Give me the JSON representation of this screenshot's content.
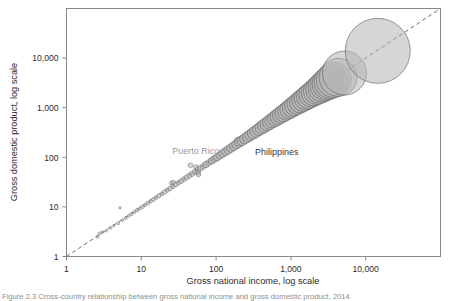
{
  "figure": {
    "background": "#ffffff",
    "caption": "Figure 2.3  Cross-country relationship between gross national income and gross domestic product, 2014"
  },
  "chart_data": {
    "type": "scatter",
    "title": "",
    "xlabel": "Gross national income, log scale",
    "ylabel": "Gross domestic product, log scale",
    "xscale": "log",
    "yscale": "log",
    "xlim": [
      1,
      100000
    ],
    "ylim": [
      1,
      100000
    ],
    "xticks": [
      1,
      10,
      100,
      1000,
      10000
    ],
    "xticklabels": [
      "1",
      "10",
      "100",
      "1,000",
      "10,000"
    ],
    "yticks": [
      1,
      10,
      100,
      1000,
      10000
    ],
    "yticklabels": [
      "1",
      "10",
      "100",
      "1,000",
      "10,000"
    ],
    "grid": false,
    "legend": null,
    "reference_line": {
      "type": "identity",
      "style": "dashed",
      "color": "#6e6e6e",
      "from": [
        1,
        1
      ],
      "to": [
        100000,
        100000
      ]
    },
    "marker_style": {
      "shape": "circle",
      "fill": "#b5b5b5",
      "fill_opacity": 0.55,
      "stroke": "#6b6b6b",
      "size_encodes": "population"
    },
    "annotations": [
      {
        "text": "Puerto Rico",
        "color": "#9a9a9a",
        "x": 26,
        "y": 115
      },
      {
        "text": "Philippines",
        "color": "#3a3a3a",
        "x": 330,
        "y": 110
      }
    ],
    "points": [
      {
        "x": 2.6,
        "y": 2.5,
        "r": 1.6
      },
      {
        "x": 2.75,
        "y": 2.9,
        "r": 1.5
      },
      {
        "x": 3.0,
        "y": 3.1,
        "r": 1.4
      },
      {
        "x": 3.4,
        "y": 3.3,
        "r": 1.3
      },
      {
        "x": 3.9,
        "y": 3.8,
        "r": 1.4
      },
      {
        "x": 4.3,
        "y": 4.2,
        "r": 1.3
      },
      {
        "x": 4.9,
        "y": 4.7,
        "r": 1.5
      },
      {
        "x": 5.2,
        "y": 9.6,
        "r": 1.2
      },
      {
        "x": 5.6,
        "y": 5.4,
        "r": 1.4
      },
      {
        "x": 6.2,
        "y": 6.0,
        "r": 1.5
      },
      {
        "x": 6.8,
        "y": 6.6,
        "r": 1.4
      },
      {
        "x": 7.4,
        "y": 7.2,
        "r": 1.6
      },
      {
        "x": 8.1,
        "y": 7.9,
        "r": 1.5
      },
      {
        "x": 8.8,
        "y": 8.6,
        "r": 1.7
      },
      {
        "x": 9.6,
        "y": 9.3,
        "r": 1.6
      },
      {
        "x": 10.4,
        "y": 10.1,
        "r": 1.8
      },
      {
        "x": 11.3,
        "y": 11.0,
        "r": 1.7
      },
      {
        "x": 12.3,
        "y": 12.0,
        "r": 1.9
      },
      {
        "x": 13.4,
        "y": 13.1,
        "r": 1.8
      },
      {
        "x": 14.6,
        "y": 14.2,
        "r": 2.0
      },
      {
        "x": 15.9,
        "y": 15.5,
        "r": 1.9
      },
      {
        "x": 17.3,
        "y": 16.9,
        "r": 2.1
      },
      {
        "x": 18.8,
        "y": 18.3,
        "r": 2.0
      },
      {
        "x": 20.5,
        "y": 20.0,
        "r": 2.2
      },
      {
        "x": 22.3,
        "y": 21.7,
        "r": 2.1
      },
      {
        "x": 24.3,
        "y": 23.7,
        "r": 2.3
      },
      {
        "x": 25.2,
        "y": 30.5,
        "r": 2.0
      },
      {
        "x": 26.4,
        "y": 25.8,
        "r": 2.2
      },
      {
        "x": 26.9,
        "y": 31.2,
        "r": 2.1
      },
      {
        "x": 28.8,
        "y": 28.1,
        "r": 2.4
      },
      {
        "x": 31.3,
        "y": 30.5,
        "r": 2.3
      },
      {
        "x": 34.1,
        "y": 33.2,
        "r": 2.5
      },
      {
        "x": 37.1,
        "y": 36.2,
        "r": 2.4
      },
      {
        "x": 40.4,
        "y": 39.4,
        "r": 2.6
      },
      {
        "x": 44.0,
        "y": 42.9,
        "r": 2.5
      },
      {
        "x": 45.5,
        "y": 69.0,
        "r": 2.4
      },
      {
        "x": 47.9,
        "y": 46.7,
        "r": 2.7
      },
      {
        "x": 52.1,
        "y": 50.8,
        "r": 2.6
      },
      {
        "x": 54.0,
        "y": 63.0,
        "r": 2.5
      },
      {
        "x": 56.8,
        "y": 55.3,
        "r": 2.8
      },
      {
        "x": 57.5,
        "y": 49.5,
        "r": 2.4
      },
      {
        "x": 58.2,
        "y": 45.0,
        "r": 2.3
      },
      {
        "x": 61.8,
        "y": 60.2,
        "r": 2.9
      },
      {
        "x": 67.3,
        "y": 65.6,
        "r": 2.8
      },
      {
        "x": 73.3,
        "y": 71.4,
        "r": 3.1
      },
      {
        "x": 79.8,
        "y": 77.8,
        "r": 3.0
      },
      {
        "x": 86.9,
        "y": 84.7,
        "r": 3.3
      },
      {
        "x": 94.6,
        "y": 92.2,
        "r": 3.4
      },
      {
        "x": 103,
        "y": 100,
        "r": 3.6
      },
      {
        "x": 112,
        "y": 109,
        "r": 3.7
      },
      {
        "x": 122,
        "y": 119,
        "r": 3.9
      },
      {
        "x": 133,
        "y": 130,
        "r": 4.0
      },
      {
        "x": 145,
        "y": 141,
        "r": 4.2
      },
      {
        "x": 158,
        "y": 154,
        "r": 4.3
      },
      {
        "x": 172,
        "y": 168,
        "r": 4.5
      },
      {
        "x": 187,
        "y": 182,
        "r": 4.6
      },
      {
        "x": 200,
        "y": 208,
        "r": 4.4
      },
      {
        "x": 204,
        "y": 199,
        "r": 4.8
      },
      {
        "x": 222,
        "y": 216,
        "r": 5.0
      },
      {
        "x": 242,
        "y": 236,
        "r": 5.2
      },
      {
        "x": 264,
        "y": 257,
        "r": 5.4
      },
      {
        "x": 287,
        "y": 280,
        "r": 5.6
      },
      {
        "x": 313,
        "y": 305,
        "r": 5.8
      },
      {
        "x": 341,
        "y": 332,
        "r": 6.0
      },
      {
        "x": 371,
        "y": 362,
        "r": 6.2
      },
      {
        "x": 404,
        "y": 394,
        "r": 6.5
      },
      {
        "x": 440,
        "y": 429,
        "r": 6.7
      },
      {
        "x": 479,
        "y": 467,
        "r": 7.0
      },
      {
        "x": 522,
        "y": 509,
        "r": 7.2
      },
      {
        "x": 568,
        "y": 554,
        "r": 7.5
      },
      {
        "x": 619,
        "y": 603,
        "r": 7.8
      },
      {
        "x": 674,
        "y": 657,
        "r": 8.1
      },
      {
        "x": 734,
        "y": 716,
        "r": 8.4
      },
      {
        "x": 800,
        "y": 780,
        "r": 8.7
      },
      {
        "x": 871,
        "y": 849,
        "r": 9.0
      },
      {
        "x": 949,
        "y": 925,
        "r": 9.4
      },
      {
        "x": 1034,
        "y": 1008,
        "r": 9.7
      },
      {
        "x": 1126,
        "y": 1098,
        "r": 10.1
      },
      {
        "x": 1226,
        "y": 1196,
        "r": 10.5
      },
      {
        "x": 1336,
        "y": 1302,
        "r": 10.9
      },
      {
        "x": 1455,
        "y": 1419,
        "r": 11.3
      },
      {
        "x": 1585,
        "y": 1545,
        "r": 11.7
      },
      {
        "x": 1727,
        "y": 1684,
        "r": 12.2
      },
      {
        "x": 1881,
        "y": 1834,
        "r": 12.6
      },
      {
        "x": 2049,
        "y": 1998,
        "r": 13.1
      },
      {
        "x": 2232,
        "y": 2176,
        "r": 13.6
      },
      {
        "x": 2432,
        "y": 2371,
        "r": 14.2
      },
      {
        "x": 2649,
        "y": 2583,
        "r": 14.8
      },
      {
        "x": 2886,
        "y": 2814,
        "r": 15.4
      },
      {
        "x": 3144,
        "y": 3066,
        "r": 16.1
      },
      {
        "x": 3426,
        "y": 3340,
        "r": 16.8
      },
      {
        "x": 3732,
        "y": 3639,
        "r": 17.5
      },
      {
        "x": 4270,
        "y": 4100,
        "r": 19.0
      },
      {
        "x": 5200,
        "y": 5000,
        "r": 22.0
      },
      {
        "x": 14500,
        "y": 14000,
        "r": 32.5
      }
    ]
  }
}
